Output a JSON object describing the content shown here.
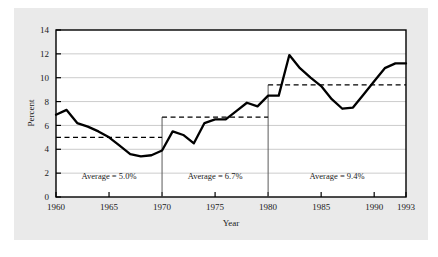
{
  "chart_data": {
    "type": "line",
    "title": "",
    "xlabel": "Year",
    "ylabel": "Percent",
    "xlim": [
      1960,
      1993
    ],
    "ylim": [
      0,
      14
    ],
    "ytick_values": [
      0,
      2,
      4,
      6,
      8,
      10,
      12,
      14
    ],
    "ytick_labels": [
      "0",
      "2",
      "4",
      "6",
      "8",
      "10",
      "12",
      "14"
    ],
    "xtick_values": [
      1960,
      1965,
      1970,
      1975,
      1980,
      1985,
      1990,
      1993
    ],
    "xtick_labels": [
      "1960",
      "1965",
      "1970",
      "1975",
      "1980",
      "1985",
      "1990",
      "1993"
    ],
    "grid": "horizontal",
    "legend": "none",
    "line_color": "#000000",
    "grid_color": "#b4b4b4",
    "series": [
      {
        "name": "Percent",
        "x": [
          1960,
          1961,
          1962,
          1963,
          1964,
          1965,
          1966,
          1967,
          1968,
          1969,
          1970,
          1971,
          1972,
          1973,
          1974,
          1975,
          1976,
          1977,
          1978,
          1979,
          1980,
          1981,
          1982,
          1983,
          1984,
          1985,
          1986,
          1987,
          1988,
          1989,
          1990,
          1991,
          1992,
          1993
        ],
        "values": [
          6.9,
          7.3,
          6.2,
          5.9,
          5.5,
          5.0,
          4.3,
          3.6,
          3.4,
          3.5,
          3.9,
          5.5,
          5.2,
          4.5,
          6.2,
          6.5,
          6.5,
          7.2,
          7.9,
          7.6,
          8.5,
          8.5,
          11.9,
          10.8,
          10.0,
          9.3,
          8.2,
          7.4,
          7.5,
          8.6,
          9.7,
          10.8,
          11.2,
          11.2
        ]
      }
    ],
    "periods": [
      {
        "label": "Average = 5.0%",
        "start": 1960,
        "end": 1970,
        "average": 5.0
      },
      {
        "label": "Average = 6.7%",
        "start": 1970,
        "end": 1980,
        "average": 6.7
      },
      {
        "label": "Average = 9.4%",
        "start": 1980,
        "end": 1993,
        "average": 9.4
      }
    ]
  }
}
